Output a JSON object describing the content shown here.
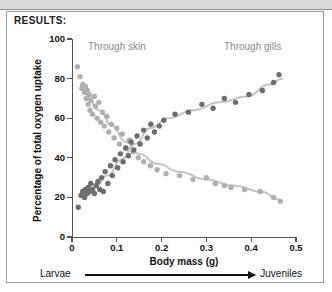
{
  "document": {
    "section_label": "RESULTS:"
  },
  "chart_data": {
    "type": "scatter",
    "title": "",
    "xlabel": "Body mass (g)",
    "ylabel": "Percentage of total oxygen uptake",
    "xlim": [
      0,
      0.5
    ],
    "ylim": [
      0,
      100
    ],
    "xticks": [
      "0",
      "0.1",
      "0.2",
      "0.3",
      "0.4",
      "0.5"
    ],
    "xtick_values": [
      0,
      0.1,
      0.2,
      0.3,
      0.4,
      0.5
    ],
    "yticks": [
      "0",
      "20",
      "40",
      "60",
      "80",
      "100"
    ],
    "ytick_values": [
      0,
      20,
      40,
      60,
      80,
      100
    ],
    "grid": false,
    "legend_position": "in-plot-annotations",
    "colors": {
      "skin": "#b0b0b0",
      "gills": "#6e6e6e",
      "axis": "#555555",
      "text": "#111111",
      "annotation": "#8a8a8a"
    },
    "series": [
      {
        "name": "Through skin",
        "color": "#b0b0b0",
        "marker": "circle",
        "trend": "decreasing",
        "points": [
          [
            0.012,
            86
          ],
          [
            0.018,
            81
          ],
          [
            0.022,
            75
          ],
          [
            0.024,
            77
          ],
          [
            0.028,
            73
          ],
          [
            0.03,
            76
          ],
          [
            0.032,
            70
          ],
          [
            0.034,
            74
          ],
          [
            0.036,
            67
          ],
          [
            0.038,
            72
          ],
          [
            0.04,
            64
          ],
          [
            0.042,
            69
          ],
          [
            0.046,
            62
          ],
          [
            0.05,
            71
          ],
          [
            0.052,
            66
          ],
          [
            0.056,
            60
          ],
          [
            0.06,
            68
          ],
          [
            0.064,
            58
          ],
          [
            0.068,
            63
          ],
          [
            0.072,
            56
          ],
          [
            0.078,
            61
          ],
          [
            0.082,
            53
          ],
          [
            0.088,
            57
          ],
          [
            0.094,
            50
          ],
          [
            0.1,
            55
          ],
          [
            0.106,
            47
          ],
          [
            0.112,
            52
          ],
          [
            0.12,
            45
          ],
          [
            0.128,
            49
          ],
          [
            0.136,
            43
          ],
          [
            0.148,
            40
          ],
          [
            0.16,
            38
          ],
          [
            0.175,
            36
          ],
          [
            0.19,
            34
          ],
          [
            0.21,
            32
          ],
          [
            0.24,
            31
          ],
          [
            0.27,
            29
          ],
          [
            0.3,
            30
          ],
          [
            0.32,
            27
          ],
          [
            0.34,
            26
          ],
          [
            0.355,
            25
          ],
          [
            0.385,
            24
          ],
          [
            0.42,
            23
          ],
          [
            0.45,
            20
          ],
          [
            0.465,
            18
          ]
        ]
      },
      {
        "name": "Through gills",
        "color": "#6e6e6e",
        "marker": "circle",
        "trend": "increasing",
        "points": [
          [
            0.014,
            15
          ],
          [
            0.02,
            21
          ],
          [
            0.024,
            23
          ],
          [
            0.028,
            20
          ],
          [
            0.03,
            24
          ],
          [
            0.034,
            22
          ],
          [
            0.036,
            25
          ],
          [
            0.04,
            23
          ],
          [
            0.042,
            27
          ],
          [
            0.046,
            24
          ],
          [
            0.05,
            22
          ],
          [
            0.054,
            26
          ],
          [
            0.058,
            28
          ],
          [
            0.062,
            24
          ],
          [
            0.066,
            30
          ],
          [
            0.07,
            23
          ],
          [
            0.074,
            33
          ],
          [
            0.08,
            27
          ],
          [
            0.086,
            36
          ],
          [
            0.09,
            31
          ],
          [
            0.096,
            39
          ],
          [
            0.102,
            35
          ],
          [
            0.108,
            42
          ],
          [
            0.114,
            38
          ],
          [
            0.12,
            45
          ],
          [
            0.126,
            41
          ],
          [
            0.132,
            48
          ],
          [
            0.138,
            44
          ],
          [
            0.145,
            51
          ],
          [
            0.152,
            47
          ],
          [
            0.16,
            54
          ],
          [
            0.168,
            50
          ],
          [
            0.176,
            57
          ],
          [
            0.184,
            53
          ],
          [
            0.195,
            56
          ],
          [
            0.205,
            59
          ],
          [
            0.23,
            62
          ],
          [
            0.26,
            63
          ],
          [
            0.29,
            67
          ],
          [
            0.315,
            65
          ],
          [
            0.34,
            70
          ],
          [
            0.365,
            68
          ],
          [
            0.395,
            72
          ],
          [
            0.425,
            74
          ],
          [
            0.45,
            78
          ],
          [
            0.462,
            82
          ]
        ]
      }
    ],
    "trend_lines": [
      {
        "name": "Through skin trend",
        "color": "#c4c4c4",
        "path": [
          [
            0.03,
            73
          ],
          [
            0.06,
            64
          ],
          [
            0.09,
            56
          ],
          [
            0.12,
            48
          ],
          [
            0.15,
            42
          ],
          [
            0.19,
            37
          ],
          [
            0.24,
            33
          ],
          [
            0.3,
            29
          ],
          [
            0.36,
            26
          ],
          [
            0.42,
            23
          ],
          [
            0.465,
            19
          ]
        ]
      },
      {
        "name": "Through gills trend",
        "color": "#c4c4c4",
        "path": [
          [
            0.022,
            21
          ],
          [
            0.05,
            25
          ],
          [
            0.08,
            31
          ],
          [
            0.11,
            39
          ],
          [
            0.14,
            47
          ],
          [
            0.175,
            55
          ],
          [
            0.215,
            60
          ],
          [
            0.27,
            64
          ],
          [
            0.33,
            68
          ],
          [
            0.39,
            71
          ],
          [
            0.44,
            77
          ],
          [
            0.47,
            80
          ]
        ]
      }
    ],
    "annotations": [
      {
        "text": "Through skin",
        "x": 0.06,
        "y": 95,
        "color": "#8a8a8a"
      },
      {
        "text": "Through gills",
        "x": 0.36,
        "y": 95,
        "color": "#8a8a8a"
      }
    ],
    "stage_axis": {
      "left_label": "Larvae",
      "right_label": "Juveniles",
      "arrow_direction": "right"
    }
  }
}
